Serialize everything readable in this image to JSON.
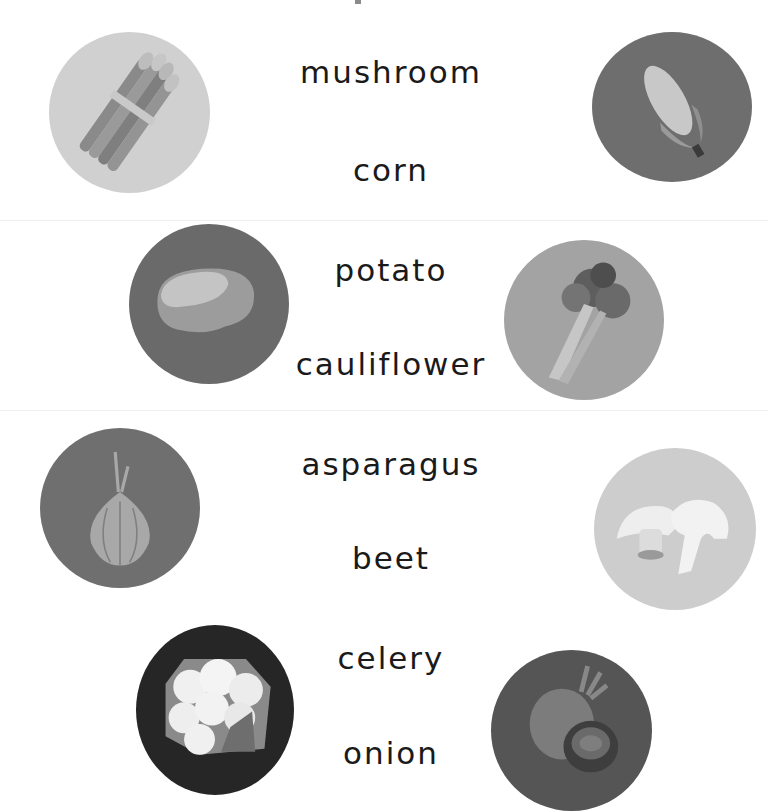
{
  "worksheet": {
    "words": [
      "mushroom",
      "corn",
      "potato",
      "cauliflower",
      "asparagus",
      "beet",
      "celery",
      "onion"
    ],
    "pictures": [
      {
        "name": "asparagus",
        "bg": "#d0d0d0"
      },
      {
        "name": "corn",
        "bg": "#6e6e6e"
      },
      {
        "name": "potato",
        "bg": "#6a6a6a"
      },
      {
        "name": "celery",
        "bg": "#a3a3a3"
      },
      {
        "name": "onion",
        "bg": "#6f6f6f"
      },
      {
        "name": "mushroom",
        "bg": "#cdcdcd"
      },
      {
        "name": "cauliflower",
        "bg": "#262626"
      },
      {
        "name": "beet",
        "bg": "#555555"
      }
    ]
  }
}
